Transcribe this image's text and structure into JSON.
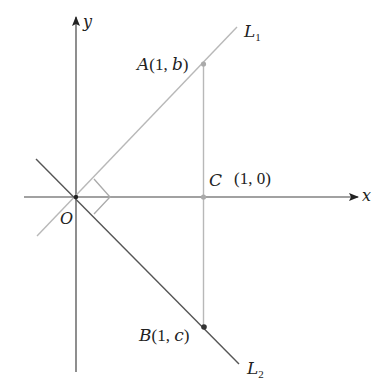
{
  "diagram": {
    "type": "geometry-coordinate-diagram",
    "axes": {
      "x_label": "x",
      "y_label": "y",
      "origin_label": "O"
    },
    "lines": [
      {
        "name": "L",
        "subscript": "1",
        "description": "line through origin with positive slope, passes through A"
      },
      {
        "name": "L",
        "subscript": "2",
        "description": "line through origin with negative slope, passes through B"
      }
    ],
    "points": {
      "A": {
        "letter": "A",
        "coords": "(1, b)",
        "open": "(",
        "x": "1",
        "sep": ", ",
        "y": "b",
        "close": ")"
      },
      "B": {
        "letter": "B",
        "coords": "(1, c)",
        "open": "(",
        "x": "1",
        "sep": ", ",
        "y": "c",
        "close": ")"
      },
      "C": {
        "letter": "C",
        "coords": "(1, 0)"
      }
    },
    "right_angle_marker": "at origin between L1 and L2",
    "colors": {
      "axis": "#444444",
      "L1": "#b8b8b8",
      "L2": "#555555",
      "vertical_segment": "#b8b8b8",
      "point_A": "#aaaaaa",
      "point_B": "#333333",
      "point_C": "#aaaaaa"
    }
  }
}
